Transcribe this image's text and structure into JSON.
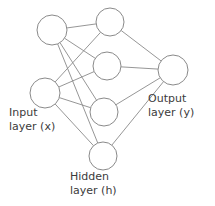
{
  "diagram": {
    "type": "neural-network",
    "background_color": "#ffffff",
    "stroke_color": "#8a8a8a",
    "node_fill_color": "#ffffff",
    "text_color": "#3b3b3b",
    "labels": {
      "input": {
        "line1": "Input",
        "line2": "layer (x)"
      },
      "hidden": {
        "line1": "Hidden",
        "line2": "layer (h)"
      },
      "output": {
        "line1": "Output",
        "line2": "layer (y)"
      }
    },
    "layers": [
      {
        "id": "input",
        "name": "Input layer (x)",
        "node_count": 2,
        "nodes": [
          {
            "id": "x1",
            "cx": 52,
            "cy": 30,
            "r": 15
          },
          {
            "id": "x2",
            "cx": 45,
            "cy": 93,
            "r": 15
          }
        ]
      },
      {
        "id": "hidden",
        "name": "Hidden layer (h)",
        "node_count": 4,
        "nodes": [
          {
            "id": "h1",
            "cx": 110,
            "cy": 22,
            "r": 14
          },
          {
            "id": "h2",
            "cx": 107,
            "cy": 66,
            "r": 14
          },
          {
            "id": "h3",
            "cx": 104,
            "cy": 112,
            "r": 14
          },
          {
            "id": "h4",
            "cx": 103,
            "cy": 156,
            "r": 14
          }
        ]
      },
      {
        "id": "output",
        "name": "Output layer (y)",
        "node_count": 1,
        "nodes": [
          {
            "id": "y1",
            "cx": 173,
            "cy": 70,
            "r": 15
          }
        ]
      }
    ],
    "edges": [
      {
        "from": "x1",
        "to": "h1"
      },
      {
        "from": "x1",
        "to": "h2"
      },
      {
        "from": "x1",
        "to": "h3"
      },
      {
        "from": "x1",
        "to": "h4"
      },
      {
        "from": "x2",
        "to": "h1"
      },
      {
        "from": "x2",
        "to": "h2"
      },
      {
        "from": "x2",
        "to": "h3"
      },
      {
        "from": "x2",
        "to": "h4"
      },
      {
        "from": "h1",
        "to": "y1"
      },
      {
        "from": "h2",
        "to": "y1"
      },
      {
        "from": "h3",
        "to": "y1"
      },
      {
        "from": "h4",
        "to": "y1"
      }
    ]
  }
}
